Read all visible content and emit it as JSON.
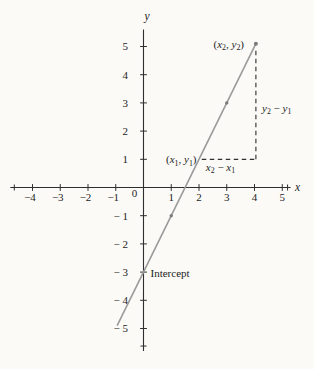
{
  "figure": {
    "bg": "#fbfaf7",
    "axis_color": "#2e2e2e",
    "line_color": "#9a9a9a",
    "dot_color": "#7b7b7b",
    "dash_color": "#333333",
    "text_color": "#1d1d1d"
  },
  "chart_data": {
    "type": "line",
    "title": "",
    "xlabel": "x",
    "ylabel": "y",
    "origin_label": "0",
    "xlim": [
      -4.8,
      5.3
    ],
    "ylim": [
      -5.8,
      5.6
    ],
    "grid": false,
    "x_ticks": [
      -4,
      -3,
      -2,
      -1,
      1,
      2,
      3,
      4,
      5
    ],
    "y_ticks": [
      5,
      4,
      3,
      2,
      1,
      -1,
      -2,
      -3,
      -4,
      -5
    ],
    "series": [
      {
        "name": "line through (x1,y1) and (x2,y2)",
        "slope": 2,
        "intercept": -3,
        "x_start": -0.95,
        "x_end": 4.05,
        "points_on_line": [
          [
            -0.95,
            -4.9
          ],
          [
            0,
            -3
          ],
          [
            1,
            -1
          ],
          [
            2,
            1
          ],
          [
            3,
            3
          ],
          [
            4,
            5
          ]
        ]
      }
    ],
    "marked_points": [
      {
        "x": 1,
        "y": -1
      },
      {
        "x": 3,
        "y": 3
      },
      {
        "x": 4.05,
        "y": 5.1
      }
    ],
    "dashed_segments": [
      {
        "name": "rise",
        "x1": 4.05,
        "y1": 4.85,
        "x2": 4.05,
        "y2": 1
      },
      {
        "name": "run",
        "x1": 2.1,
        "y1": 1,
        "x2": 4.05,
        "y2": 1
      }
    ],
    "annotations": [
      {
        "id": "point2-label",
        "text": "(x2, y2)",
        "tokens": [
          [
            "(",
            ""
          ],
          [
            "x",
            "i"
          ],
          [
            "2",
            "s"
          ],
          [
            ", ",
            ""
          ],
          [
            "y",
            "i"
          ],
          [
            "2",
            "s"
          ],
          [
            ")",
            ""
          ]
        ],
        "anchor_point": [
          4,
          5
        ]
      },
      {
        "id": "point1-label",
        "text": "(x1, y1)",
        "tokens": [
          [
            "(",
            ""
          ],
          [
            "x",
            "i"
          ],
          [
            "1",
            "s"
          ],
          [
            ", ",
            ""
          ],
          [
            "y",
            "i"
          ],
          [
            "1",
            "s"
          ],
          [
            ")",
            ""
          ]
        ],
        "anchor_point": [
          2,
          1
        ]
      },
      {
        "id": "rise-label",
        "text": "y2 − y1",
        "tokens": [
          [
            "y",
            "i"
          ],
          [
            "2",
            "s"
          ],
          [
            " − ",
            ""
          ],
          [
            "y",
            "i"
          ],
          [
            "1",
            "s"
          ]
        ],
        "anchor_point": [
          4,
          3
        ]
      },
      {
        "id": "run-label",
        "text": "x2 − x1",
        "tokens": [
          [
            "x",
            "i"
          ],
          [
            "2",
            "s"
          ],
          [
            " − ",
            ""
          ],
          [
            "x",
            "i"
          ],
          [
            "1",
            "s"
          ]
        ],
        "anchor_point": [
          3,
          1
        ]
      },
      {
        "id": "intercept-label",
        "text": "Intercept",
        "tokens": [
          [
            "Intercept",
            ""
          ]
        ],
        "anchor_point": [
          0,
          -3
        ]
      }
    ]
  }
}
